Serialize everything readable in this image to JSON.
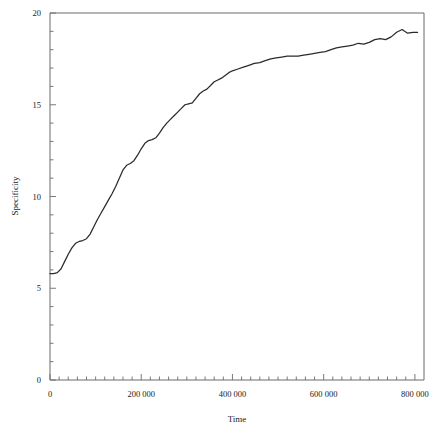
{
  "figure": {
    "partial_top_text": "",
    "background_color": "#ffffff",
    "frame_color": "#6b6b6b",
    "line_color": "#2b2b2b"
  },
  "chart_data": {
    "type": "line",
    "title": "",
    "xlabel": "Time",
    "ylabel": "Specificity",
    "xlim": [
      0,
      820000
    ],
    "ylim": [
      0,
      20
    ],
    "grid": false,
    "legend": null,
    "x_major_ticks": [
      0,
      200000,
      400000,
      600000,
      800000
    ],
    "x_major_tick_labels": [
      "0",
      "200 000",
      "400 000",
      "600 000",
      "800 000"
    ],
    "x_minor_tick_step": 20000,
    "y_major_ticks": [
      0,
      5,
      10,
      15,
      20
    ],
    "y_major_tick_labels": [
      "0",
      "5",
      "10",
      "15",
      "20"
    ],
    "y_minor_tick_step": 1,
    "series": [
      {
        "name": "Specificity",
        "color": "#2b2b2b",
        "x": [
          0,
          8000,
          16000,
          24000,
          32000,
          40000,
          48000,
          56000,
          64000,
          72000,
          80000,
          88000,
          96000,
          104000,
          112000,
          120000,
          128000,
          136000,
          144000,
          152000,
          160000,
          168000,
          176000,
          184000,
          192000,
          200000,
          208000,
          216000,
          224000,
          232000,
          240000,
          248000,
          256000,
          264000,
          272000,
          280000,
          288000,
          296000,
          304000,
          312000,
          320000,
          328000,
          336000,
          344000,
          352000,
          360000,
          368000,
          376000,
          384000,
          392000,
          400000,
          412000,
          424000,
          436000,
          448000,
          460000,
          472000,
          484000,
          496000,
          508000,
          520000,
          532000,
          544000,
          556000,
          568000,
          580000,
          592000,
          604000,
          616000,
          628000,
          640000,
          652000,
          664000,
          676000,
          688000,
          700000,
          712000,
          724000,
          736000,
          748000,
          760000,
          772000,
          784000,
          796000,
          806000
        ],
        "y": [
          5.8,
          5.8,
          5.85,
          6.05,
          6.45,
          6.85,
          7.2,
          7.45,
          7.55,
          7.6,
          7.7,
          7.95,
          8.35,
          8.75,
          9.1,
          9.45,
          9.8,
          10.15,
          10.55,
          11.0,
          11.45,
          11.7,
          11.8,
          11.95,
          12.25,
          12.6,
          12.9,
          13.05,
          13.1,
          13.2,
          13.45,
          13.75,
          14.0,
          14.2,
          14.4,
          14.6,
          14.8,
          15.0,
          15.05,
          15.1,
          15.35,
          15.6,
          15.75,
          15.85,
          16.05,
          16.25,
          16.35,
          16.45,
          16.6,
          16.75,
          16.85,
          16.95,
          17.05,
          17.15,
          17.25,
          17.3,
          17.4,
          17.5,
          17.55,
          17.6,
          17.65,
          17.65,
          17.65,
          17.7,
          17.75,
          17.8,
          17.85,
          17.9,
          18.0,
          18.1,
          18.15,
          18.2,
          18.25,
          18.35,
          18.3,
          18.4,
          18.55,
          18.6,
          18.55,
          18.7,
          18.95,
          19.1,
          18.9,
          18.95,
          18.95
        ]
      }
    ]
  }
}
